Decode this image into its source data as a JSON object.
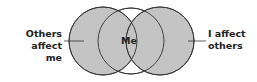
{
  "diagram": {
    "type": "venn",
    "circles": [
      {
        "id": "left",
        "fill": "#c4c4c4",
        "stroke": "#333333"
      },
      {
        "id": "center",
        "fill": "#ffffff",
        "stroke": "#333333"
      },
      {
        "id": "right",
        "fill": "#c4c4c4",
        "stroke": "#333333"
      }
    ],
    "labels": {
      "left_line1": "Others",
      "left_line2": "affect me",
      "center": "Me",
      "right_line1": "I affect",
      "right_line2": "others"
    }
  }
}
